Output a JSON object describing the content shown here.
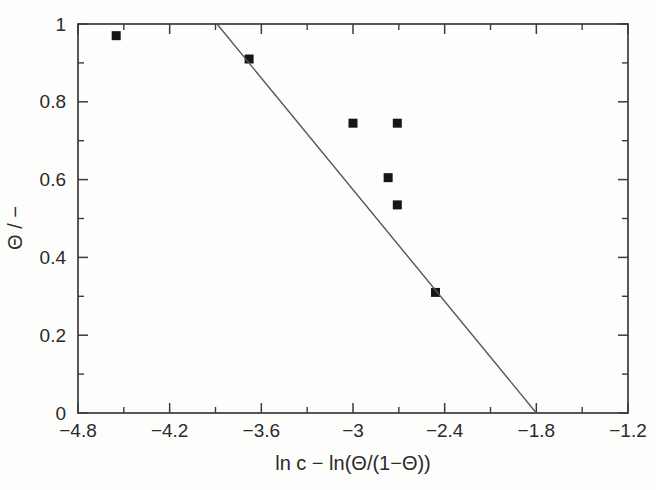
{
  "figure": {
    "background": "#fdfdfc",
    "axis_color": "#3a3a3a",
    "tick_text_color": "#2a2a2a",
    "point_color": "#161616",
    "fit_line_color": "#555555"
  },
  "chart_data": {
    "type": "scatter",
    "title": "",
    "xlabel": "ln c − ln(Θ/(1−Θ))",
    "ylabel": "Θ / −",
    "xlim": [
      -4.8,
      -1.2
    ],
    "ylim": [
      0,
      1
    ],
    "grid": false,
    "legend": null,
    "x_major_ticks": [
      -4.8,
      -4.2,
      -3.6,
      -3.0,
      -2.4,
      -1.8,
      -1.2
    ],
    "x_tick_labels": [
      "−4.8",
      "−4.2",
      "−3.6",
      "−3",
      "−2.4",
      "−1.8",
      "−1.2"
    ],
    "x_minor_ticks": [
      -4.5,
      -3.9,
      -3.3,
      -2.7,
      -2.1,
      -1.5
    ],
    "y_major_ticks": [
      0,
      0.2,
      0.4,
      0.6,
      0.8,
      1
    ],
    "y_tick_labels": [
      "0",
      "0.2",
      "0.4",
      "0.6",
      "0.8",
      "1"
    ],
    "y_minor_ticks": [
      0.1,
      0.3,
      0.5,
      0.7,
      0.9
    ],
    "series": [
      {
        "name": "measured-points",
        "kind": "scatter",
        "marker": "filled-square",
        "points": [
          [
            -4.55,
            0.97
          ],
          [
            -3.68,
            0.91
          ],
          [
            -3.0,
            0.745
          ],
          [
            -2.71,
            0.745
          ],
          [
            -2.77,
            0.605
          ],
          [
            -2.71,
            0.535
          ],
          [
            -2.46,
            0.31
          ]
        ]
      },
      {
        "name": "fit-line",
        "kind": "line",
        "points": [
          [
            -3.89,
            1.0
          ],
          [
            -1.8,
            0.0
          ]
        ]
      }
    ]
  }
}
